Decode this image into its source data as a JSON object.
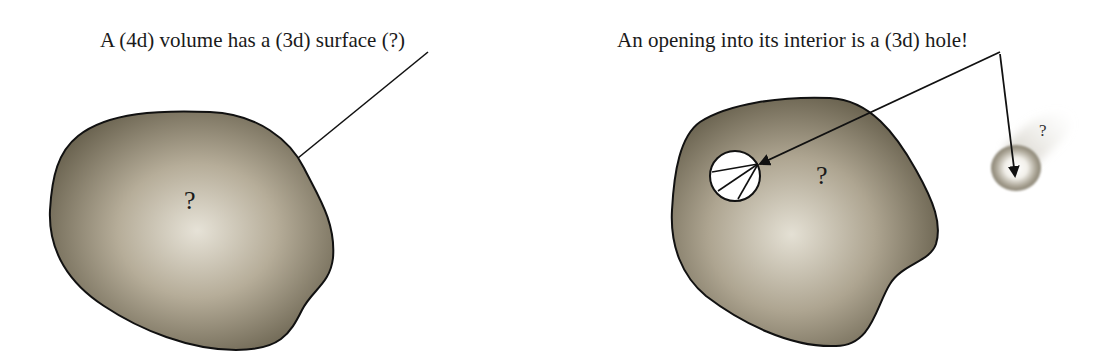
{
  "left_panel": {
    "caption": "A (4d) volume has a (3d) surface (?)",
    "blob_label": "?"
  },
  "right_panel": {
    "caption": "An opening into its interior is a (3d) hole!",
    "blob_label": "?",
    "sphere_label": "?"
  },
  "colors": {
    "blob_dark": "#6b6450",
    "blob_light": "#e2ded2",
    "outline": "#111111",
    "text": "#1a1a1a"
  }
}
